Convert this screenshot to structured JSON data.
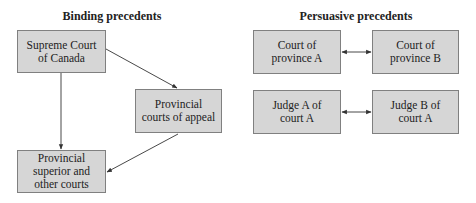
{
  "headings": {
    "binding": "Binding precedents",
    "persuasive": "Persuasive precedents"
  },
  "binding": {
    "supreme_court": {
      "lines": [
        "Supreme Court",
        "of Canada"
      ]
    },
    "courts_of_appeal": {
      "lines": [
        "Provincial",
        "courts of appeal"
      ]
    },
    "superior_courts": {
      "lines": [
        "Provincial",
        "superior and",
        "other courts"
      ]
    }
  },
  "persuasive": {
    "court_province_a": {
      "lines": [
        "Court of",
        "province A"
      ]
    },
    "court_province_b": {
      "lines": [
        "Court of",
        "province B"
      ]
    },
    "judge_a": {
      "lines": [
        "Judge A of",
        "court A"
      ]
    },
    "judge_b": {
      "lines": [
        "Judge B of",
        "court A"
      ]
    }
  },
  "edges": [
    {
      "from": "Supreme Court of Canada",
      "to": "Provincial courts of appeal",
      "type": "directed"
    },
    {
      "from": "Supreme Court of Canada",
      "to": "Provincial superior and other courts",
      "type": "directed"
    },
    {
      "from": "Provincial courts of appeal",
      "to": "Provincial superior and other courts",
      "type": "directed"
    },
    {
      "from": "Court of province A",
      "to": "Court of province B",
      "type": "bidirectional"
    },
    {
      "from": "Judge A of court A",
      "to": "Judge B of court A",
      "type": "bidirectional"
    }
  ],
  "colors": {
    "box_fill": "#d6d6d6",
    "box_border": "#808080",
    "line": "#333333"
  }
}
